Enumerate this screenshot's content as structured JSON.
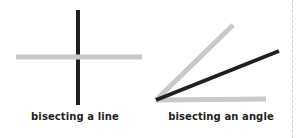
{
  "figure": {
    "background_color": "#ffffff",
    "divider": {
      "name": "dashed-divider",
      "color": "#cfcfcf",
      "style": "dashed",
      "orientation": "vertical"
    },
    "colors": {
      "construction_gray": "#c9c9c9",
      "result_black": "#231f20",
      "caption_text": "#231f20",
      "divider_gray": "#cfcfcf"
    },
    "panels": [
      {
        "id": "bisecting-a-line",
        "caption": "bisecting a line",
        "description": "A light gray horizontal line crossed at its midpoint by a black perpendicular vertical line.",
        "elements": [
          {
            "name": "original-line",
            "role": "original",
            "color": "#c9c9c9",
            "orientation": "horizontal",
            "x1": 16,
            "y1": 57,
            "x2": 142,
            "y2": 57,
            "stroke_width": 5
          },
          {
            "name": "bisector-line",
            "role": "bisector",
            "color": "#231f20",
            "orientation": "vertical",
            "x1": 78,
            "y1": 10,
            "x2": 78,
            "y2": 105,
            "stroke_width": 4
          }
        ]
      },
      {
        "id": "bisecting-an-angle",
        "caption": "bisecting an angle",
        "description": "Two light gray rays from a shared vertex form an angle; a black ray from the same vertex bisects it.",
        "vertex": {
          "x": 6,
          "y": 100
        },
        "elements": [
          {
            "name": "angle-ray-base",
            "role": "original",
            "color": "#c9c9c9",
            "x1": 6,
            "y1": 100,
            "x2": 116,
            "y2": 99,
            "stroke_width": 5
          },
          {
            "name": "angle-ray-upper",
            "role": "original",
            "color": "#c9c9c9",
            "x1": 6,
            "y1": 100,
            "x2": 83,
            "y2": 25,
            "stroke_width": 5
          },
          {
            "name": "angle-bisector",
            "role": "bisector",
            "color": "#231f20",
            "x1": 6,
            "y1": 100,
            "x2": 129,
            "y2": 51,
            "stroke_width": 4
          }
        ]
      }
    ]
  }
}
